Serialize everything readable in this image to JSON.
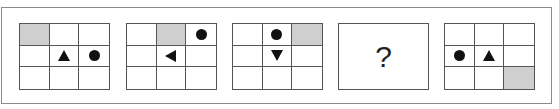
{
  "puzzle": {
    "panels": [
      {
        "type": "grid",
        "shaded": [
          0,
          0
        ],
        "items": [
          {
            "shape": "triangle-up",
            "row": 1,
            "col": 1
          },
          {
            "shape": "circle",
            "row": 1,
            "col": 2
          }
        ]
      },
      {
        "type": "grid",
        "shaded": [
          0,
          1
        ],
        "items": [
          {
            "shape": "circle",
            "row": 0,
            "col": 2
          },
          {
            "shape": "triangle-left",
            "row": 1,
            "col": 1
          }
        ]
      },
      {
        "type": "grid",
        "shaded": [
          0,
          2
        ],
        "items": [
          {
            "shape": "circle",
            "row": 0,
            "col": 1
          },
          {
            "shape": "triangle-down",
            "row": 1,
            "col": 1
          }
        ]
      },
      {
        "type": "question",
        "label": "?"
      },
      {
        "type": "grid",
        "shaded": [
          2,
          2
        ],
        "items": [
          {
            "shape": "circle",
            "row": 1,
            "col": 0
          },
          {
            "shape": "triangle-up",
            "row": 1,
            "col": 1
          }
        ]
      }
    ]
  }
}
